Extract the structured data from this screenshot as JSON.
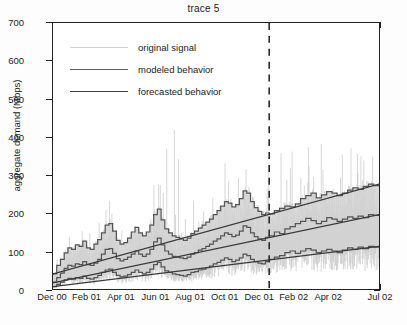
{
  "chart_data": {
    "type": "line",
    "title": "trace 5",
    "xlabel": "",
    "ylabel": "aggregate demand (Mbps)",
    "ylim": [
      0,
      700
    ],
    "yticks": [
      0,
      100,
      200,
      300,
      400,
      500,
      600,
      700
    ],
    "xticks": [
      "Dec 00",
      "Feb 01",
      "Apr 01",
      "Jun 01",
      "Aug 01",
      "Oct 01",
      "Dec 01",
      "Feb 02",
      "Apr 02",
      "Jul 02"
    ],
    "xtick_positions": [
      0,
      2,
      4,
      6,
      8,
      10,
      12,
      14,
      16,
      19
    ],
    "x_unit": "months since Dec 2000",
    "xlim": [
      0,
      19
    ],
    "grid": false,
    "legend_position": "upper left",
    "annotations": [
      {
        "type": "vline",
        "style": "dashed",
        "x": 12.6,
        "label": "forecast start (Dec 01)"
      }
    ],
    "colors": {
      "original_signal": "#c9c9c9",
      "modeled_behavior": "#555555",
      "forecasted_behavior": "#3a3a3a",
      "band_fill": "#d2d2d2",
      "axis": "#222222",
      "background": "#ffffff"
    },
    "series": [
      {
        "name": "original signal",
        "type": "noise_envelope",
        "description": "light gray high-frequency daily samples spanning band, with tall sparse spikes",
        "spike_max": 620
      },
      {
        "name": "modeled behavior",
        "type": "step",
        "description": "stepped upper band, median and lower band for the modeled region (Dec 00 - Dec 01)",
        "upper": [
          40,
          62,
          78,
          95,
          108,
          104,
          116,
          112,
          126,
          108,
          104,
          118,
          130,
          148,
          168,
          172,
          152,
          128,
          118,
          122,
          134,
          150,
          162,
          148,
          140,
          150,
          168,
          196,
          210,
          182,
          158,
          148,
          140,
          136,
          132,
          128,
          134,
          146,
          152,
          160,
          168,
          176,
          184,
          196,
          206,
          218,
          230,
          226,
          216,
          222,
          238,
          258,
          252,
          230,
          214,
          204,
          196,
          200
        ],
        "median": [
          18,
          30,
          42,
          54,
          62,
          60,
          66,
          64,
          72,
          64,
          62,
          68,
          78,
          92,
          104,
          106,
          94,
          80,
          74,
          78,
          84,
          92,
          100,
          92,
          86,
          92,
          104,
          124,
          134,
          116,
          100,
          92,
          86,
          84,
          82,
          80,
          84,
          92,
          96,
          102,
          106,
          112,
          118,
          126,
          132,
          140,
          148,
          144,
          138,
          142,
          152,
          166,
          162,
          148,
          138,
          132,
          128,
          136
        ],
        "lower": [
          6,
          12,
          18,
          24,
          28,
          26,
          30,
          28,
          34,
          28,
          26,
          30,
          36,
          44,
          50,
          52,
          44,
          36,
          32,
          34,
          38,
          44,
          50,
          44,
          40,
          44,
          52,
          64,
          70,
          58,
          48,
          44,
          40,
          38,
          36,
          34,
          38,
          44,
          46,
          50,
          52,
          56,
          60,
          66,
          70,
          76,
          82,
          78,
          72,
          76,
          82,
          92,
          88,
          78,
          72,
          68,
          66,
          72
        ]
      },
      {
        "name": "forecasted behavior",
        "type": "linear_trend",
        "description": "straight trend lines extending from the forecast boundary to the right edge",
        "upper_start": 195,
        "upper_end": 276,
        "median_start": 136,
        "median_end": 196,
        "lower_start": 78,
        "lower_end": 112
      },
      {
        "name": "observed steps in forecast window",
        "type": "step",
        "description": "stepped observed upper/median/lower continuing past the dashed line",
        "upper": [
          198,
          206,
          212,
          218,
          216,
          224,
          238,
          246,
          252,
          240,
          248,
          256,
          252,
          246,
          252,
          260,
          266,
          262,
          270,
          276,
          272
        ],
        "median": [
          140,
          150,
          146,
          158,
          164,
          172,
          178,
          186,
          180,
          172,
          178,
          188,
          184,
          178,
          184,
          190,
          186,
          192,
          188,
          196,
          194
        ],
        "lower": [
          78,
          84,
          88,
          96,
          100,
          94,
          100,
          106,
          102,
          96,
          100,
          104,
          100,
          96,
          102,
          108,
          104,
          110,
          106,
          112,
          110
        ]
      }
    ]
  },
  "legend": {
    "items": [
      {
        "label": "original signal",
        "color": "#cccccc",
        "width": 1.2
      },
      {
        "label": "modeled behavior",
        "color": "#5a5a5a",
        "width": 1.4
      },
      {
        "label": "forecasted behavior",
        "color": "#3a3a3a",
        "width": 1.6
      }
    ]
  }
}
